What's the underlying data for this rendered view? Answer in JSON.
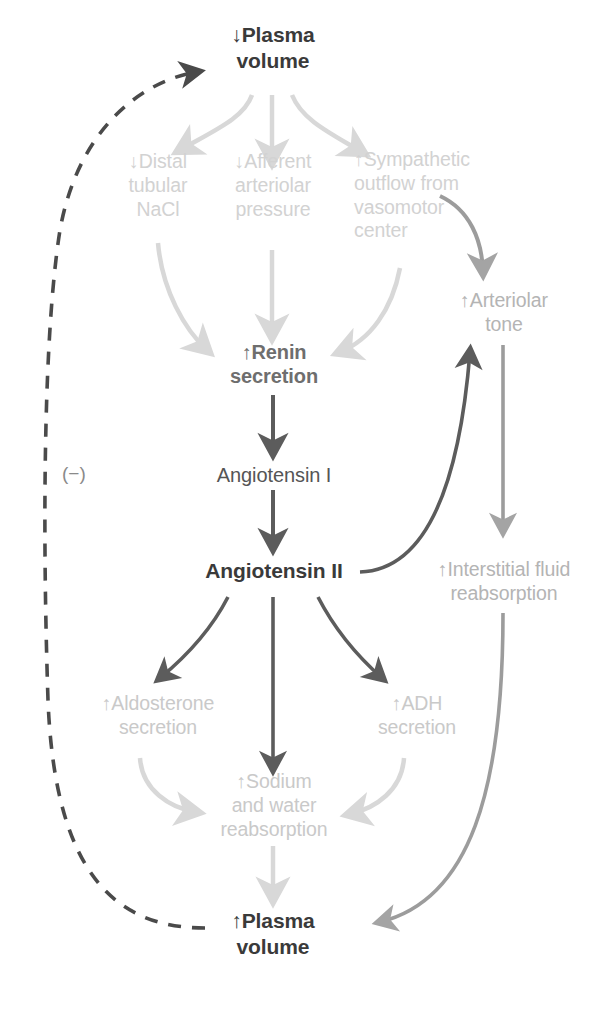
{
  "diagram": {
    "colors": {
      "dark_text": "#3a3a3a",
      "mid_text": "#6e6e6e",
      "light_text": "#d2d2d2",
      "gray_text": "#b4b4b4",
      "dark_arrow": "#5c5c5c",
      "light_arrow": "#d8d8d8",
      "mid_arrow": "#9c9c9c",
      "background": "#ffffff"
    },
    "nodes": {
      "plasma_volume_down": "↓Plasma\nvolume",
      "distal_tubular_nacl": "↓Distal\ntubular\nNaCl",
      "afferent_arteriolar_pressure": "↓Afferent\narteriolar\npressure",
      "sympathetic_outflow": "↑Sympathetic\noutflow from\nvasomotor\ncenter",
      "arteriolar_tone": "↑Arteriolar\ntone",
      "renin_secretion": "↑Renin\nsecretion",
      "angiotensin_i": "Angiotensin I",
      "angiotensin_ii": "Angiotensin II",
      "interstitial_fluid_reabsorption": "↑Interstitial fluid\nreabsorption",
      "aldosterone_secretion": "↑Aldosterone\nsecretion",
      "adh_secretion": "↑ADH\nsecretion",
      "sodium_water_reabsorption": "↑Sodium\nand water\nreabsorption",
      "plasma_volume_up": "↑Plasma\nvolume"
    },
    "annotations": {
      "negative_feedback_sign": "(−)"
    }
  }
}
